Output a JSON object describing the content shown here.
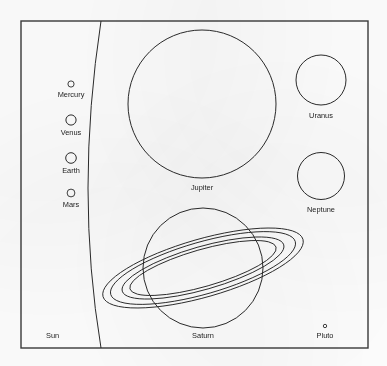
{
  "figure": {
    "kind": "line-drawing",
    "background_color": "#fefefe",
    "stroke_color": "#2b2b2b",
    "frame_color": "#3a3a3a"
  },
  "frame": {
    "x": 21,
    "y": 21,
    "width": 347,
    "height": 327
  },
  "sun": {
    "label": "Sun",
    "label_x": 46,
    "label_y": 338,
    "label_anchor": "start",
    "arc_description": "large-circle-limb-arc",
    "arc_top_x": 101,
    "arc_top_y": 21,
    "arc_bulge_x": 88,
    "arc_bulge_y": 188,
    "arc_bottom_x": 101,
    "arc_bottom_y": 348
  },
  "bodies": [
    {
      "name": "mercury",
      "label": "Mercury",
      "cx": 71,
      "cy": 84,
      "r": 3.1,
      "label_x": 71,
      "label_y": 97
    },
    {
      "name": "venus",
      "label": "Venus",
      "cx": 71,
      "cy": 120,
      "r": 5.1,
      "label_x": 71,
      "label_y": 135
    },
    {
      "name": "earth",
      "label": "Earth",
      "cx": 71,
      "cy": 158,
      "r": 5.3,
      "label_x": 71,
      "label_y": 173
    },
    {
      "name": "mars",
      "label": "Mars",
      "cx": 71,
      "cy": 193,
      "r": 3.9,
      "label_x": 71,
      "label_y": 207
    },
    {
      "name": "jupiter",
      "label": "Jupiter",
      "cx": 202,
      "cy": 104,
      "r": 74,
      "label_x": 202,
      "label_y": 190
    },
    {
      "name": "uranus",
      "label": "Uranus",
      "cx": 321,
      "cy": 80,
      "r": 25,
      "label_x": 321,
      "label_y": 118
    },
    {
      "name": "neptune",
      "label": "Neptune",
      "cx": 321,
      "cy": 176,
      "r": 23.5,
      "label_x": 321,
      "label_y": 212
    },
    {
      "name": "pluto",
      "label": "Pluto",
      "cx": 325,
      "cy": 326,
      "r": 1.7,
      "label_x": 325,
      "label_y": 338
    }
  ],
  "saturn": {
    "name": "saturn",
    "label": "Saturn",
    "cx": 203,
    "cy": 268,
    "r": 60,
    "label_x": 203,
    "label_y": 338,
    "ring_tilt_degrees": -16,
    "rings": [
      {
        "name": "outer-ring-outer-edge",
        "rx": 104,
        "ry": 29
      },
      {
        "name": "outer-ring-inner-edge",
        "rx": 96,
        "ry": 26
      },
      {
        "name": "inner-ring-outer-edge",
        "rx": 84,
        "ry": 21.5
      },
      {
        "name": "inner-ring-inner-edge",
        "rx": 76,
        "ry": 18.5
      }
    ]
  }
}
